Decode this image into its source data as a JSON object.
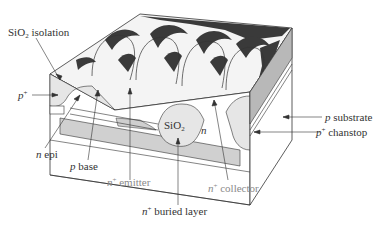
{
  "figure": {
    "colors": {
      "oxide": "#e6e6e6",
      "buried_layer": "#d0d0d0",
      "substrate_side": "#b8b8b8",
      "line": "#333333",
      "label_dark": "#333333",
      "label_gray": "#8a8a8a"
    }
  },
  "labels": {
    "sio2_isolation": {
      "prefix": "SiO",
      "sub": "2",
      "suffix": " isolation"
    },
    "p_plus": {
      "italic": "p",
      "sup": "+"
    },
    "n_epi": {
      "italic": "n",
      "text": " epi"
    },
    "p_base": {
      "italic": "p",
      "text": " base"
    },
    "n_plus_emitter": {
      "italic": "n",
      "sup": "+",
      "text": " emitter"
    },
    "n_plus_buried_layer": {
      "italic": "n",
      "sup": "+",
      "text": " buried layer"
    },
    "n_plus_collector": {
      "italic": "n",
      "sup": "+",
      "text": " collector"
    },
    "p_substrate": {
      "italic": "p",
      "text": " substrate"
    },
    "p_plus_chanstop": {
      "italic": "p",
      "sup": "+",
      "text": " chanstop"
    },
    "inner_sio2": {
      "prefix": "SiO",
      "sub": "2"
    },
    "inner_n": {
      "italic": "n"
    }
  }
}
